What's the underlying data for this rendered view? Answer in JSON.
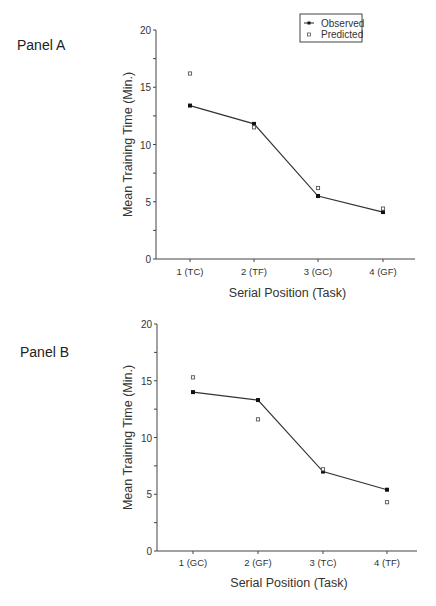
{
  "legend": {
    "observed": "Observed",
    "predicted": "Predicted"
  },
  "chart_data": [
    {
      "type": "line",
      "panel": "Panel A",
      "title": "Panel A",
      "xlabel": "Serial Position (Task)",
      "ylabel": "Mean Training Time (Min.)",
      "categories": [
        "1 (TC)",
        "2 (TF)",
        "3 (GC)",
        "4 (GF)"
      ],
      "ylim": [
        0,
        20
      ],
      "yticks": [
        0,
        5,
        10,
        15,
        20
      ],
      "grid": false,
      "legend_position": "top-right",
      "series": [
        {
          "name": "Observed",
          "style": "filled-square-line",
          "values": [
            13.4,
            11.8,
            5.5,
            4.1
          ]
        },
        {
          "name": "Predicted",
          "style": "open-square-marker",
          "values": [
            16.2,
            11.5,
            6.2,
            4.4
          ]
        }
      ]
    },
    {
      "type": "line",
      "panel": "Panel B",
      "title": "Panel B",
      "xlabel": "Serial Position (Task)",
      "ylabel": "Mean Training Time (Min.)",
      "categories": [
        "1 (GC)",
        "2 (GF)",
        "3 (TC)",
        "4 (TF)"
      ],
      "ylim": [
        0,
        20
      ],
      "yticks": [
        0,
        5,
        10,
        15,
        20
      ],
      "grid": false,
      "series": [
        {
          "name": "Observed",
          "style": "filled-square-line",
          "values": [
            14.0,
            13.3,
            7.0,
            5.4
          ]
        },
        {
          "name": "Predicted",
          "style": "open-square-marker",
          "values": [
            15.3,
            11.6,
            7.2,
            4.3
          ]
        }
      ]
    }
  ]
}
